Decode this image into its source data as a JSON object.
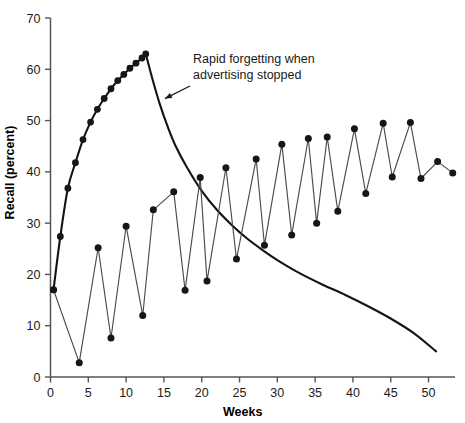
{
  "chart_data": {
    "type": "line",
    "title": "",
    "xlabel": "Weeks",
    "ylabel": "Recall (percent)",
    "xlim": [
      0,
      53.5
    ],
    "ylim": [
      0,
      70
    ],
    "xticks": [
      0,
      5,
      10,
      15,
      20,
      25,
      30,
      35,
      40,
      45,
      50
    ],
    "yticks": [
      0,
      10,
      20,
      30,
      40,
      50,
      60,
      70
    ],
    "grid": false,
    "legend": null,
    "annotations": [
      {
        "text_line1": "Rapid forgetting when",
        "text_line2": "advertising stopped",
        "points_to_x": 14.6,
        "points_to_y": 53.5
      }
    ],
    "series": [
      {
        "name": "continuous-advertising-buildup",
        "style": "line-with-markers",
        "markers": true,
        "x": [
          0.4,
          1.3,
          2.3,
          3.3,
          4.3,
          5.3,
          6.2,
          7.1,
          8.0,
          8.9,
          9.7,
          10.5,
          11.3,
          12.1,
          12.6
        ],
        "y": [
          17.0,
          27.4,
          36.8,
          41.8,
          46.3,
          49.7,
          52.2,
          54.3,
          56.2,
          57.8,
          59.0,
          60.2,
          61.2,
          62.2,
          63.0
        ]
      },
      {
        "name": "forgetting-decay-after-advertising-stopped",
        "style": "smooth-line",
        "markers": false,
        "x": [
          12.6,
          13.5,
          14.5,
          15.5,
          16.5,
          18.0,
          20.0,
          22.0,
          24.0,
          26.0,
          28.0,
          30.0,
          33.0,
          36.0,
          39.0,
          42.0,
          45.0,
          48.0,
          51.0
        ],
        "y": [
          63.0,
          58.0,
          53.0,
          48.8,
          45.2,
          41.0,
          36.3,
          32.6,
          29.6,
          27.0,
          24.8,
          22.8,
          20.2,
          18.0,
          16.0,
          13.8,
          11.4,
          8.6,
          5.0
        ]
      },
      {
        "name": "pulsed-advertising-sawtooth",
        "style": "line-with-markers",
        "markers": true,
        "x": [
          0.4,
          3.8,
          6.3,
          8.0,
          10.0,
          12.2,
          13.6,
          16.3,
          17.8,
          19.8,
          20.7,
          23.2,
          24.6,
          27.2,
          28.3,
          30.6,
          31.9,
          34.1,
          35.2,
          36.6,
          38.0,
          40.2,
          41.7,
          44.0,
          45.2,
          47.6,
          49.0,
          51.2,
          53.2
        ],
        "y": [
          17.0,
          2.8,
          25.2,
          7.6,
          29.4,
          12.0,
          32.6,
          36.1,
          16.9,
          38.9,
          18.7,
          40.8,
          23.0,
          42.5,
          25.7,
          45.4,
          27.7,
          46.5,
          30.0,
          46.8,
          32.3,
          48.4,
          35.8,
          49.5,
          39.0,
          49.6,
          38.7,
          42.0,
          39.8
        ]
      }
    ]
  }
}
